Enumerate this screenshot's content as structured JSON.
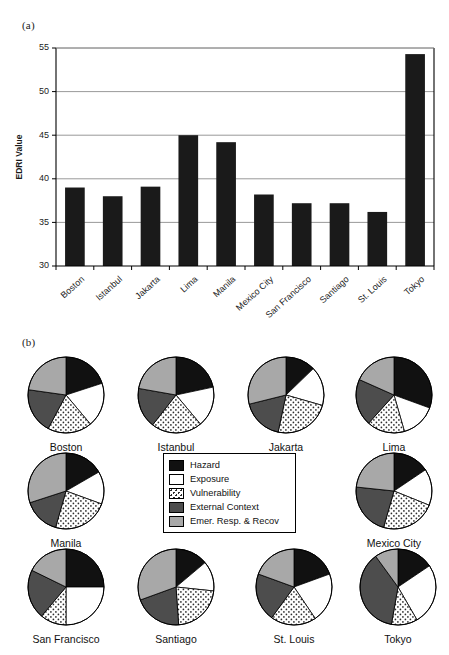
{
  "panels": {
    "a_label": "(a)",
    "b_label": "(b)"
  },
  "colors": {
    "hazard": "#111111",
    "exposure": "#ffffff",
    "vulnerability": "#ffffff",
    "external_context": "#4d4d4d",
    "emergency_response": "#a8a8a8",
    "gridline": "#8d8d8d",
    "axis": "#000000",
    "bar_fill": "#1a1a1a"
  },
  "chart_data": [
    {
      "type": "bar",
      "title": "",
      "xlabel": "",
      "ylabel": "EDRI Value",
      "ylim": [
        30,
        55
      ],
      "yticks": [
        30,
        35,
        40,
        45,
        50,
        55
      ],
      "grid": true,
      "legend": "none",
      "categories": [
        "Boston",
        "Istanbul",
        "Jakarta",
        "Lima",
        "Manila",
        "Mexico City",
        "San Francisco",
        "Santiago",
        "St. Louis",
        "Tokyo"
      ],
      "values": [
        39.0,
        38.0,
        39.1,
        45.0,
        44.2,
        38.2,
        37.2,
        37.2,
        36.2,
        54.3
      ]
    },
    {
      "type": "pie",
      "title": "",
      "legend_position": "center",
      "legend_entries": [
        "Hazard",
        "Exposure",
        "Vulnerability",
        "External Context",
        "Emer. Resp. & Recov"
      ],
      "slice_labels": [
        "Hazard",
        "Exposure",
        "Vulnerability",
        "External Context",
        "Emer. Resp. & Recov"
      ],
      "pies": [
        {
          "name": "Boston",
          "values": [
            72,
            68,
            68,
            70,
            82
          ]
        },
        {
          "name": "Istanbul",
          "values": [
            78,
            62,
            78,
            62,
            80
          ]
        },
        {
          "name": "Jakarta",
          "values": [
            46,
            60,
            86,
            64,
            104
          ]
        },
        {
          "name": "Lima",
          "values": [
            110,
            54,
            58,
            72,
            66
          ]
        },
        {
          "name": "Manila",
          "values": [
            60,
            50,
            86,
            56,
            108
          ]
        },
        {
          "name": "Mexico City",
          "values": [
            56,
            56,
            84,
            80,
            84
          ]
        },
        {
          "name": "San Francisco",
          "values": [
            90,
            90,
            40,
            76,
            64
          ]
        },
        {
          "name": "Santiago",
          "values": [
            50,
            46,
            80,
            74,
            110
          ]
        },
        {
          "name": "St. Louis",
          "values": [
            70,
            76,
            70,
            74,
            70
          ]
        },
        {
          "name": "Tokyo",
          "values": [
            56,
            94,
            40,
            134,
            36
          ]
        }
      ]
    }
  ]
}
